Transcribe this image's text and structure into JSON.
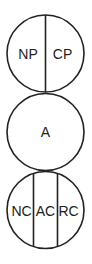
{
  "diagram": {
    "stroke_color": "#222222",
    "background": "#ffffff",
    "circles": [
      {
        "name": "top",
        "segments": [
          "NP",
          "CP"
        ]
      },
      {
        "name": "middle",
        "segments": [
          "A"
        ]
      },
      {
        "name": "bottom",
        "segments": [
          "NC",
          "AC",
          "RC"
        ]
      }
    ]
  }
}
